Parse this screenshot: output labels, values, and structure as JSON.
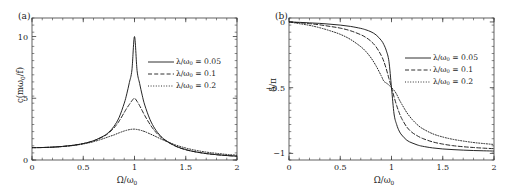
{
  "figure": {
    "panels": [
      {
        "tag": "(a)",
        "xlabel_html": "&Omega;/&omega;<sub>0</sub>",
        "ylabel_html": "c(m&omega;<sub>0</sub>/f)",
        "xticks": [
          "0",
          "0.5",
          "1",
          "1.5",
          "2"
        ],
        "yticks": [
          "0",
          "5",
          "10"
        ]
      },
      {
        "tag": "(b)",
        "xlabel_html": "&Omega;/&omega;<sub>0</sub>",
        "ylabel_html": "&delta;/&pi;",
        "xticks": [
          "0",
          "0.5",
          "1",
          "1.5",
          "2"
        ],
        "yticks": [
          "0",
          "-0.5",
          "-1"
        ]
      }
    ],
    "legend": [
      {
        "label_html": "&lambda;/&omega;<sub>0</sub> = 0.05",
        "style": "solid"
      },
      {
        "label_html": "&lambda;/&omega;<sub>0</sub> = 0.1",
        "style": "dashed"
      },
      {
        "label_html": "&lambda;/&omega;<sub>0</sub> = 0.2",
        "style": "dotted"
      }
    ],
    "line_color": "#1a1a1a",
    "frame_color": "#3a3a3a"
  },
  "chart_data": [
    {
      "type": "line",
      "title": "",
      "panel": "(a)",
      "xlabel": "Omega/omega_0",
      "ylabel": "c(m*omega_0/f)",
      "xlim": [
        0,
        2
      ],
      "ylim": [
        0,
        11.5
      ],
      "xticks": [
        0,
        0.5,
        1,
        1.5,
        2
      ],
      "yticks": [
        0,
        5,
        10
      ],
      "grid": false,
      "legend_position": "center-right",
      "description": "Amplitude resonance curves of a driven damped oscillator; peak height 1/(2*lambda/omega0) at Omega/omega0 = 1.",
      "x": [
        0,
        0.1,
        0.2,
        0.3,
        0.4,
        0.5,
        0.6,
        0.7,
        0.75,
        0.8,
        0.85,
        0.9,
        0.925,
        0.95,
        0.975,
        1.0,
        1.025,
        1.05,
        1.075,
        1.1,
        1.15,
        1.2,
        1.25,
        1.3,
        1.4,
        1.5,
        1.6,
        1.7,
        1.8,
        1.9,
        2.0
      ],
      "series": [
        {
          "name": "lambda/omega_0 = 0.05",
          "style": "solid",
          "peak_x": 1.0,
          "peak_y": 10.0,
          "values": [
            1.0,
            1.01,
            1.04,
            1.1,
            1.19,
            1.33,
            1.56,
            1.95,
            2.26,
            2.73,
            3.45,
            4.6,
            5.36,
            6.28,
            7.3,
            10.0,
            7.25,
            6.2,
            5.25,
            4.45,
            3.3,
            2.52,
            1.99,
            1.62,
            1.13,
            0.84,
            0.65,
            0.52,
            0.43,
            0.36,
            0.31
          ]
        },
        {
          "name": "lambda/omega_0 = 0.1",
          "style": "dashed",
          "peak_x": 1.0,
          "peak_y": 5.0,
          "values": [
            1.0,
            1.01,
            1.04,
            1.1,
            1.19,
            1.33,
            1.55,
            1.92,
            2.2,
            2.6,
            3.15,
            3.85,
            4.2,
            4.5,
            4.8,
            5.0,
            4.75,
            4.4,
            4.0,
            3.6,
            2.9,
            2.33,
            1.9,
            1.58,
            1.12,
            0.83,
            0.65,
            0.52,
            0.43,
            0.36,
            0.31
          ]
        },
        {
          "name": "lambda/omega_0 = 0.2",
          "style": "dotted",
          "peak_x": 1.0,
          "peak_y": 2.5,
          "values": [
            1.0,
            1.01,
            1.04,
            1.09,
            1.17,
            1.3,
            1.48,
            1.74,
            1.89,
            2.03,
            2.2,
            2.35,
            2.41,
            2.46,
            2.49,
            2.5,
            2.47,
            2.43,
            2.37,
            2.3,
            2.12,
            1.93,
            1.73,
            1.55,
            1.22,
            0.97,
            0.78,
            0.64,
            0.54,
            0.45,
            0.39
          ]
        }
      ]
    },
    {
      "type": "line",
      "title": "",
      "panel": "(b)",
      "xlabel": "Omega/omega_0",
      "ylabel": "delta/pi",
      "xlim": [
        0,
        2
      ],
      "ylim": [
        -1.05,
        0.03
      ],
      "xticks": [
        0,
        0.5,
        1,
        1.5,
        2
      ],
      "yticks": [
        0,
        -0.5,
        -1
      ],
      "grid": false,
      "legend_position": "center-right",
      "description": "Phase lag curves of a driven damped oscillator; all pass through -0.5 at Omega/omega0 = 1.",
      "x": [
        0,
        0.1,
        0.2,
        0.3,
        0.4,
        0.5,
        0.6,
        0.7,
        0.75,
        0.8,
        0.85,
        0.9,
        0.925,
        0.95,
        0.975,
        1.0,
        1.025,
        1.05,
        1.075,
        1.1,
        1.15,
        1.2,
        1.25,
        1.3,
        1.4,
        1.5,
        1.6,
        1.7,
        1.8,
        1.9,
        2.0
      ],
      "series": [
        {
          "name": "lambda/omega_0 = 0.05",
          "style": "solid",
          "values": [
            0.0,
            -0.003,
            -0.007,
            -0.011,
            -0.017,
            -0.024,
            -0.034,
            -0.049,
            -0.06,
            -0.075,
            -0.099,
            -0.14,
            -0.172,
            -0.22,
            -0.3,
            -0.5,
            -0.7,
            -0.78,
            -0.83,
            -0.86,
            -0.9,
            -0.92,
            -0.935,
            -0.945,
            -0.958,
            -0.966,
            -0.971,
            -0.975,
            -0.978,
            -0.98,
            -0.982
          ]
        },
        {
          "name": "lambda/omega_0 = 0.1",
          "style": "dashed",
          "values": [
            0.0,
            -0.006,
            -0.013,
            -0.022,
            -0.034,
            -0.047,
            -0.067,
            -0.097,
            -0.118,
            -0.147,
            -0.19,
            -0.255,
            -0.3,
            -0.36,
            -0.43,
            -0.5,
            -0.57,
            -0.635,
            -0.69,
            -0.735,
            -0.8,
            -0.84,
            -0.865,
            -0.885,
            -0.912,
            -0.929,
            -0.941,
            -0.949,
            -0.955,
            -0.96,
            -0.964
          ]
        },
        {
          "name": "lambda/omega_0 = 0.2",
          "style": "dotted",
          "values": [
            0.0,
            -0.013,
            -0.026,
            -0.044,
            -0.067,
            -0.094,
            -0.133,
            -0.188,
            -0.225,
            -0.273,
            -0.335,
            -0.41,
            -0.45,
            -0.465,
            -0.48,
            -0.5,
            -0.52,
            -0.55,
            -0.59,
            -0.625,
            -0.69,
            -0.74,
            -0.78,
            -0.81,
            -0.85,
            -0.875,
            -0.893,
            -0.906,
            -0.917,
            -0.925,
            -0.932
          ]
        }
      ]
    }
  ]
}
